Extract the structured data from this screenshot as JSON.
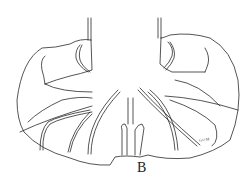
{
  "figure": {
    "label": "B",
    "signature": "GOM"
  },
  "colors": {
    "ink": "#2a2a2a",
    "background": "#ffffff"
  }
}
